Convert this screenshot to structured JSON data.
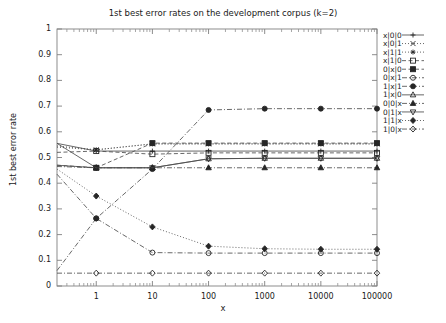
{
  "chart_data": {
    "type": "line",
    "title": "1st best error rates on the development corpus (k=2)",
    "xlabel": "x",
    "ylabel": "1st best error rate",
    "xscale": "log",
    "xlim": [
      0.2,
      100000
    ],
    "ylim": [
      0,
      1
    ],
    "grid": false,
    "legend_position": "right-outside",
    "yticks": [
      "0",
      "0.1",
      "0.2",
      "0.3",
      "0.4",
      "0.5",
      "0.6",
      "0.7",
      "0.8",
      "0.9",
      "1"
    ],
    "ytick_values": [
      0,
      0.1,
      0.2,
      0.3,
      0.4,
      0.5,
      0.6,
      0.7,
      0.8,
      0.9,
      1
    ],
    "xticks": [
      "1",
      "10",
      "100",
      "1000",
      "10000",
      "100000"
    ],
    "xtick_values": [
      1,
      10,
      100,
      1000,
      10000,
      100000
    ],
    "x": [
      0.2,
      1,
      10,
      100,
      1000,
      10000,
      100000
    ],
    "series": [
      {
        "name": "x|0|0",
        "point": "plus",
        "dash": "solid",
        "values": [
          0.555,
          0.525,
          0.525,
          0.525,
          0.525,
          0.525,
          0.525
        ]
      },
      {
        "name": "x|0|1",
        "point": "cross",
        "dash": "dot",
        "values": [
          0.545,
          0.53,
          0.553,
          0.553,
          0.553,
          0.553,
          0.553
        ]
      },
      {
        "name": "x|1|1",
        "point": "star",
        "dash": "dot",
        "values": [
          0.54,
          0.53,
          0.553,
          0.553,
          0.553,
          0.553,
          0.553
        ]
      },
      {
        "name": "x|1|0",
        "point": "opensquare",
        "dash": "dash",
        "values": [
          0.52,
          0.525,
          0.513,
          0.518,
          0.518,
          0.518,
          0.518
        ]
      },
      {
        "name": "0|x|0",
        "point": "filledsquare",
        "dash": "dash",
        "values": [
          0.47,
          0.46,
          0.556,
          0.556,
          0.556,
          0.556,
          0.556
        ]
      },
      {
        "name": "0|x|1",
        "point": "opencircle",
        "dash": "dashdot",
        "values": [
          0.435,
          0.263,
          0.13,
          0.128,
          0.128,
          0.128,
          0.128
        ]
      },
      {
        "name": "1|x|1",
        "point": "filledcircle",
        "dash": "dashdot",
        "values": [
          0.06,
          0.263,
          0.455,
          0.685,
          0.69,
          0.69,
          0.69
        ]
      },
      {
        "name": "1|x|0",
        "point": "opentriangle",
        "dash": "solid",
        "values": [
          0.47,
          0.46,
          0.46,
          0.495,
          0.497,
          0.497,
          0.497
        ]
      },
      {
        "name": "0|0|x",
        "point": "filledtriangle",
        "dash": "dashdot",
        "values": [
          0.465,
          0.46,
          0.46,
          0.46,
          0.46,
          0.46,
          0.46
        ]
      },
      {
        "name": "0|1|x",
        "point": "downtriangle",
        "dash": "solid",
        "values": [
          0.555,
          0.46,
          0.46,
          0.495,
          0.497,
          0.497,
          0.497
        ]
      },
      {
        "name": "1|1|x",
        "point": "filleddiamond",
        "dash": "dot",
        "values": [
          0.455,
          0.35,
          0.23,
          0.155,
          0.145,
          0.143,
          0.143
        ]
      },
      {
        "name": "1|0|x",
        "point": "opendiamond",
        "dash": "dashdot",
        "values": [
          0.05,
          0.05,
          0.05,
          0.05,
          0.05,
          0.05,
          0.05
        ]
      }
    ]
  }
}
